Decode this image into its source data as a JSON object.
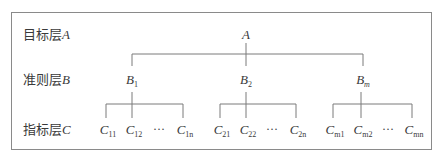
{
  "diagram": {
    "type": "hierarchy",
    "levels": [
      {
        "label": "目标层",
        "var": "A"
      },
      {
        "label": "准则层",
        "var": "B"
      },
      {
        "label": "指标层",
        "var": "C"
      }
    ],
    "root": {
      "name": "A"
    },
    "criteria": [
      {
        "base": "B",
        "sub": "1"
      },
      {
        "base": "B",
        "sub": "2"
      },
      {
        "base": "B",
        "sub": "m",
        "sub_italic": true
      }
    ],
    "indicators": [
      [
        {
          "base": "C",
          "sub": "11"
        },
        {
          "base": "C",
          "sub": "12"
        },
        {
          "ellipsis": "···"
        },
        {
          "base": "C",
          "sub": "1n"
        }
      ],
      [
        {
          "base": "C",
          "sub": "21"
        },
        {
          "base": "C",
          "sub": "22"
        },
        {
          "ellipsis": "···"
        },
        {
          "base": "C",
          "sub": "2n"
        }
      ],
      [
        {
          "base": "C",
          "sub": "m1"
        },
        {
          "base": "C",
          "sub": "m2"
        },
        {
          "ellipsis": "···"
        },
        {
          "base": "C",
          "sub": "mn"
        }
      ]
    ],
    "colors": {
      "line": "#7a7a7a",
      "text": "#3a3a3a",
      "border": "#8a8a8a"
    }
  }
}
